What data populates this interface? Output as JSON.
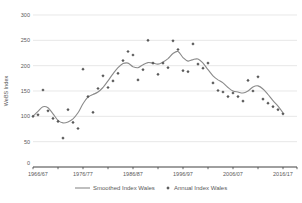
{
  "chart": {
    "ylabel": "WeBS Index",
    "legend": {
      "smoothed": "Smoothed Index Wales",
      "annual": "Annual Index Wales"
    },
    "colors": {
      "background": "#ffffff",
      "grid": "#dedede",
      "axis": "#404040",
      "smoothed_line": "#8a8a8a",
      "annual_point": "#595959",
      "text": "#595959"
    }
  },
  "chart_data": {
    "type": "line",
    "title": "",
    "xlabel": "",
    "ylabel": "WeBS Index",
    "ylim": [
      0,
      300
    ],
    "yticks": [
      0,
      50,
      100,
      150,
      200,
      250,
      300
    ],
    "xtick_labels": [
      "1966/67",
      "1976/77",
      "1986/87",
      "1996/97",
      "2006/07",
      "2016/17"
    ],
    "xtick_label_every": 10,
    "minor_xtick_every": 5,
    "grid": "horizontal",
    "legend_position": "bottom",
    "x": [
      "1966/67",
      "1967/68",
      "1968/69",
      "1969/70",
      "1970/71",
      "1971/72",
      "1972/73",
      "1973/74",
      "1974/75",
      "1975/76",
      "1976/77",
      "1977/78",
      "1978/79",
      "1979/80",
      "1980/81",
      "1981/82",
      "1982/83",
      "1983/84",
      "1984/85",
      "1985/86",
      "1986/87",
      "1987/88",
      "1988/89",
      "1989/90",
      "1990/91",
      "1991/92",
      "1992/93",
      "1993/94",
      "1994/95",
      "1995/96",
      "1996/97",
      "1997/98",
      "1998/99",
      "1999/00",
      "2000/01",
      "2001/02",
      "2002/03",
      "2003/04",
      "2004/05",
      "2005/06",
      "2006/07",
      "2007/08",
      "2008/09",
      "2009/10",
      "2010/11",
      "2011/12",
      "2012/13",
      "2013/14",
      "2014/15",
      "2015/16",
      "2016/17"
    ],
    "series": [
      {
        "name": "Smoothed Index Wales",
        "style": "line",
        "values": [
          100,
          110,
          119,
          117,
          105,
          92,
          87,
          89,
          95,
          107,
          125,
          138,
          143,
          148,
          157,
          170,
          184,
          196,
          204,
          205,
          198,
          196,
          202,
          206,
          205,
          203,
          207,
          214,
          224,
          228,
          216,
          209,
          212,
          213,
          205,
          192,
          180,
          172,
          166,
          157,
          150,
          148,
          146,
          150,
          158,
          160,
          154,
          143,
          131,
          120,
          107
        ]
      },
      {
        "name": "Annual Index Wales",
        "style": "scatter",
        "values": [
          100,
          103,
          152,
          111,
          96,
          90,
          57,
          113,
          88,
          76,
          193,
          139,
          108,
          155,
          180,
          157,
          170,
          185,
          210,
          228,
          221,
          172,
          192,
          250,
          205,
          183,
          205,
          196,
          249,
          232,
          190,
          188,
          243,
          203,
          195,
          205,
          166,
          151,
          148,
          139,
          146,
          139,
          130,
          171,
          150,
          178,
          134,
          126,
          119,
          113,
          105
        ]
      }
    ]
  }
}
